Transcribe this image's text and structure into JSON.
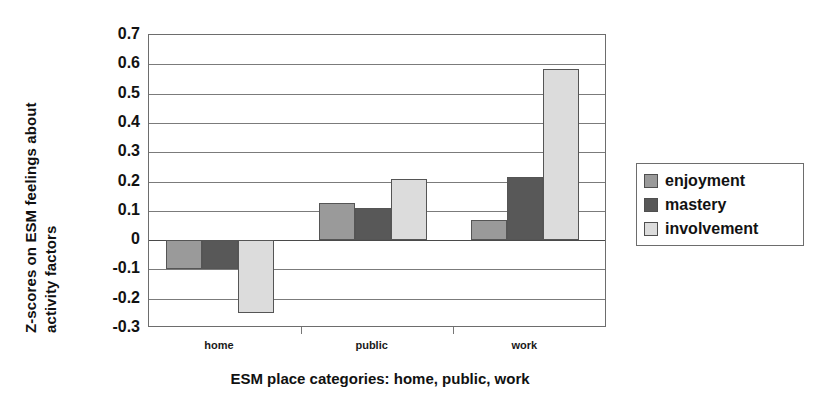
{
  "chart_data": {
    "type": "bar",
    "title": "",
    "xlabel": "ESM place categories:  home, public, work",
    "ylabel": "Z-scores on ESM feelings about activity factors",
    "ylabel_lines": [
      "Z-scores on ESM feelings about",
      "activity factors"
    ],
    "categories": [
      "home",
      "public",
      "work"
    ],
    "series": [
      {
        "name": "enjoyment",
        "values": [
          -0.1,
          0.125,
          0.07
        ],
        "color": "#9a9a9a"
      },
      {
        "name": "mastery",
        "values": [
          -0.1,
          0.11,
          0.215
        ],
        "color": "#585858"
      },
      {
        "name": "involvement",
        "values": [
          -0.25,
          0.21,
          0.585
        ],
        "color": "#dcdcdc"
      }
    ],
    "ylim": [
      -0.3,
      0.7
    ],
    "ytick_values": [
      0.7,
      0.6,
      0.5,
      0.4,
      0.3,
      0.2,
      0.1,
      0,
      -0.1,
      -0.2,
      -0.3
    ],
    "ytick_labels": [
      "0.7",
      "0.6",
      "0.5",
      "0.4",
      "0.3",
      "0.2",
      "0.1",
      "0",
      "-0.1",
      "-0.2",
      "-0.3"
    ],
    "grid": true,
    "grid_axis": "y",
    "legend_position": "right",
    "legend_entries": [
      "enjoyment",
      "mastery",
      "involvement"
    ],
    "bar_border_color": "#555555",
    "plot_border_color": "#6d6d6d",
    "gridline_color": "#7b7b7b"
  }
}
